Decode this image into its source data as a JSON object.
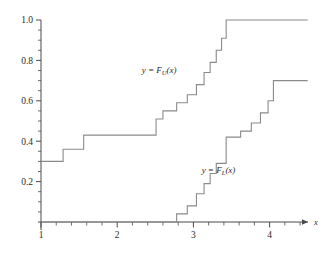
{
  "figure": {
    "axis_label_x": "x",
    "curve_label_upper": "y = F",
    "curve_label_upper_sub": "U",
    "curve_label_upper_tail": "(x)",
    "curve_label_lower": "y = F",
    "curve_label_lower_sub": "L",
    "curve_label_lower_tail": "(x)",
    "line_color": "#8a8a8a",
    "axis_color": "#4a4a4a",
    "text_color": "#2b2b2b",
    "background": "#ffffff"
  },
  "chart_data": {
    "type": "line",
    "title": "",
    "xlabel": "x",
    "ylabel": "",
    "xlim": [
      1.0,
      4.5
    ],
    "ylim": [
      0.0,
      1.0
    ],
    "grid": false,
    "legend": "inline-annotations",
    "xticks": [
      1,
      2,
      3,
      4
    ],
    "xticklabels": [
      "1",
      "2",
      "3",
      "4"
    ],
    "xminorticks": [
      1.2,
      1.4,
      1.6,
      1.8,
      2.2,
      2.4,
      2.6,
      2.8,
      3.2,
      3.4,
      3.6,
      3.8,
      4.2,
      4.4
    ],
    "yticks": [
      0.2,
      0.4,
      0.6,
      0.8,
      1.0
    ],
    "yticklabels": [
      "0.2",
      "0.4",
      "0.6",
      "0.8",
      "1.0"
    ],
    "yminorticks": [
      0.05,
      0.1,
      0.15,
      0.25,
      0.3,
      0.35,
      0.45,
      0.5,
      0.55,
      0.65,
      0.7,
      0.75,
      0.85,
      0.9,
      0.95
    ],
    "series": [
      {
        "name": "y = F_U(x)",
        "style": "step-post",
        "annotation": "y = F_U(x)",
        "annotation_x": 2.55,
        "annotation_y": 0.74,
        "x": [
          1.0,
          1.29,
          1.56,
          2.44,
          2.51,
          2.6,
          2.78,
          2.92,
          3.04,
          3.14,
          3.22,
          3.3,
          3.37,
          3.43,
          4.5
        ],
        "y": [
          0.3,
          0.36,
          0.43,
          0.43,
          0.51,
          0.55,
          0.59,
          0.63,
          0.68,
          0.74,
          0.79,
          0.85,
          0.91,
          1.0,
          1.0
        ]
      },
      {
        "name": "y = F_L(x)",
        "style": "step-post",
        "annotation": "y = F_L(x)",
        "annotation_x": 3.33,
        "annotation_y": 0.245,
        "x": [
          1.0,
          2.6,
          2.78,
          2.92,
          3.04,
          3.14,
          3.22,
          3.3,
          3.43,
          3.62,
          3.76,
          3.88,
          3.98,
          4.05,
          4.5
        ],
        "y": [
          0.0,
          0.0,
          0.04,
          0.08,
          0.14,
          0.19,
          0.24,
          0.29,
          0.42,
          0.45,
          0.49,
          0.54,
          0.6,
          0.7,
          0.7
        ]
      }
    ]
  }
}
